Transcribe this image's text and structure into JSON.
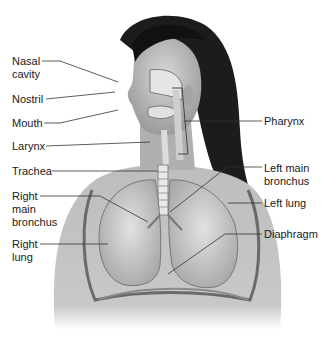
{
  "diagram": {
    "colors": {
      "background": "#ffffff",
      "text": "#1a1a1a",
      "leader": "#333333"
    },
    "labels_left": [
      {
        "id": "nasal-cavity",
        "text": "Nasal\ncavity",
        "x": 12,
        "y": 55
      },
      {
        "id": "nostril",
        "text": "Nostril",
        "x": 12,
        "y": 93
      },
      {
        "id": "mouth",
        "text": "Mouth",
        "x": 12,
        "y": 117
      },
      {
        "id": "larynx",
        "text": "Larynx",
        "x": 12,
        "y": 140
      },
      {
        "id": "trachea",
        "text": "Trachea",
        "x": 12,
        "y": 165
      },
      {
        "id": "right-main-bronchus",
        "text": "Right\nmain\nbronchus",
        "x": 12,
        "y": 190
      },
      {
        "id": "right-lung",
        "text": "Right\nlung",
        "x": 12,
        "y": 238
      }
    ],
    "labels_right": [
      {
        "id": "pharynx",
        "text": "Pharynx",
        "x": 264,
        "y": 115
      },
      {
        "id": "left-main-bronchus",
        "text": "Left main\nbronchus",
        "x": 264,
        "y": 162
      },
      {
        "id": "left-lung",
        "text": "Left lung",
        "x": 264,
        "y": 197
      },
      {
        "id": "diaphragm",
        "text": "Diaphragm",
        "x": 264,
        "y": 228
      }
    ]
  }
}
